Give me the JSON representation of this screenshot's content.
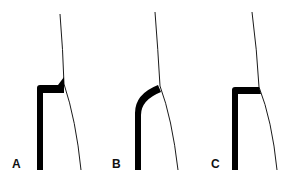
{
  "figure": {
    "panels": [
      {
        "label": "A",
        "description": "restoration margin with square shoulder and excess (overhang wedge)"
      },
      {
        "label": "B",
        "description": "restoration margin with rounded/curved shoulder"
      },
      {
        "label": "C",
        "description": "restoration margin with square shoulder, flush"
      }
    ]
  },
  "colors": {
    "ink": "#000000",
    "background": "#ffffff"
  }
}
